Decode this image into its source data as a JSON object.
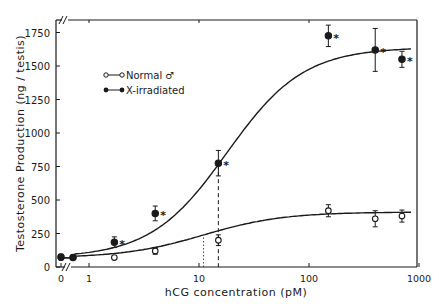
{
  "chart_data": {
    "type": "line",
    "title": "",
    "xlabel": "hCG concentration (pM)",
    "ylabel": "Testosterone Production (ng / testis)",
    "x_scale": "log (with break after 0)",
    "x_ticks": [
      "0",
      "1",
      "10",
      "100",
      "1000"
    ],
    "y_ticks": [
      "0",
      "250",
      "500",
      "750",
      "1000",
      "1250",
      "1500",
      "1750"
    ],
    "ylim": [
      0,
      1850
    ],
    "xlim": [
      0,
      1000
    ],
    "grid": false,
    "legend_position": "upper-left inside",
    "x": [
      0,
      0.5,
      1.7,
      4,
      15,
      150,
      400,
      700
    ],
    "series": [
      {
        "name": "Normal ♂",
        "marker": "open-circle",
        "values": [
          70,
          70,
          70,
          120,
          200,
          420,
          360,
          380
        ],
        "errors": [
          15,
          10,
          10,
          25,
          40,
          45,
          60,
          45
        ],
        "significant": [
          false,
          false,
          false,
          false,
          false,
          false,
          false,
          false
        ]
      },
      {
        "name": "X-irradiated",
        "marker": "filled-circle",
        "values": [
          75,
          70,
          185,
          400,
          775,
          1725,
          1620,
          1550
        ],
        "errors": [
          20,
          15,
          40,
          55,
          95,
          80,
          160,
          60
        ],
        "significant": [
          false,
          false,
          true,
          true,
          true,
          true,
          true,
          true
        ]
      }
    ],
    "annotations": [
      {
        "type": "dashed-vertical-line",
        "x": 15,
        "series": "X-irradiated",
        "note": "ED50 X-irradiated"
      },
      {
        "type": "dotted-vertical-line",
        "x": 11,
        "series": "Normal ♂",
        "note": "ED50 Normal"
      },
      {
        "type": "asterisk",
        "text": "*",
        "note": "significant difference"
      }
    ],
    "legend": [
      "Normal ♂",
      "X-irradiated"
    ]
  },
  "labels": {
    "xlabel": "hCG concentration (pM)",
    "ylabel": "Testosterone Production (ng / testis)",
    "legend_normal": "Normal ♂",
    "legend_xirr": "X-irradiated",
    "asterisk": "*"
  }
}
